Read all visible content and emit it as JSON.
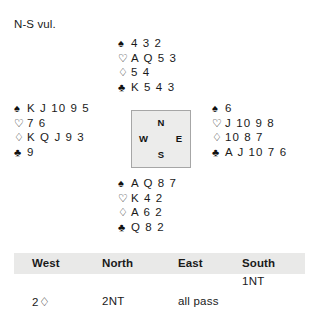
{
  "board": {
    "vulnerability": "N-S vul."
  },
  "symbols": {
    "spade": "♠",
    "heart": "♡",
    "diamond": "♢",
    "club": "♣"
  },
  "compass": {
    "north": "N",
    "west": "W",
    "east": "E",
    "south": "S"
  },
  "hands": {
    "north": {
      "label": "North",
      "spades": "4 3 2",
      "hearts": "A Q 5 3",
      "diamonds": "5 4",
      "clubs": "K 5 4 3"
    },
    "west": {
      "label": "West",
      "spades": "K J 10 9 5",
      "hearts": "7 6",
      "diamonds": "K Q J 9 3",
      "clubs": "9"
    },
    "east": {
      "label": "East",
      "spades": "6",
      "hearts": "J 10 9 8",
      "diamonds": "10 8 7",
      "clubs": "A J 10 7 6"
    },
    "south": {
      "label": "South",
      "spades": "A Q 8 7",
      "hearts": "K 4 2",
      "diamonds": "A 6 2",
      "clubs": "Q 8 2"
    }
  },
  "auction": {
    "headers": {
      "west": "West",
      "north": "North",
      "east": "East",
      "south": "South"
    },
    "rows": [
      {
        "west": "",
        "north": "",
        "east": "",
        "south": "1NT"
      },
      {
        "west": "2♢",
        "north": "2NT",
        "east": "all pass",
        "south": ""
      }
    ]
  }
}
